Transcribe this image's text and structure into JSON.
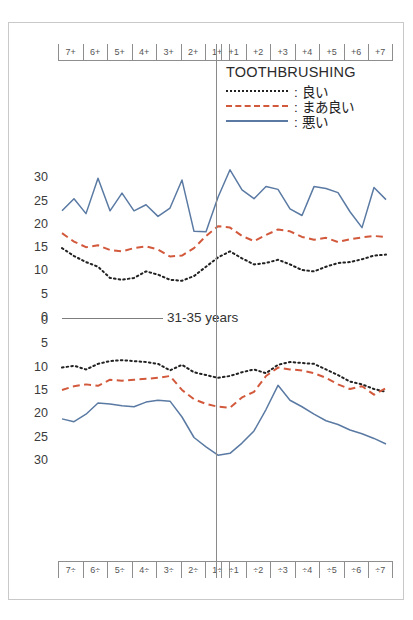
{
  "figure": {
    "center_label": "31-35 years",
    "legend": {
      "title": "TOOTHBRUSHING",
      "entries": [
        {
          "label": ": 良い",
          "style": "dotted",
          "color": "#222222"
        },
        {
          "label": ": まあ良い",
          "style": "dashed",
          "color": "#d2593c"
        },
        {
          "label": ": 悪い",
          "style": "solid",
          "color": "#5a7aa3"
        }
      ]
    },
    "upper_tooth_labels_left": [
      "7",
      "6",
      "5",
      "4",
      "3",
      "2",
      "1"
    ],
    "upper_tooth_labels_right": [
      "1",
      "2",
      "3",
      "4",
      "5",
      "6",
      "7"
    ],
    "lower_tooth_labels_left": [
      "7",
      "6",
      "5",
      "4",
      "3",
      "2",
      "1"
    ],
    "lower_tooth_labels_right": [
      "1",
      "2",
      "3",
      "4",
      "5",
      "6",
      "7"
    ],
    "upper_yticks": [
      "30",
      "25",
      "20",
      "15",
      "10",
      "5",
      "0"
    ],
    "lower_yticks": [
      "0",
      "5",
      "10",
      "15",
      "20",
      "25",
      "30"
    ]
  },
  "chart_data": {
    "type": "line",
    "title": "TOOTHBRUSHING",
    "subtitle": "31-35 years",
    "xlabel": "",
    "ylabel": "",
    "grid": false,
    "legend_position": "top-right",
    "panels": [
      {
        "name": "upper-arch",
        "ylim": [
          0,
          32
        ],
        "yticks": [
          30,
          25,
          20,
          15,
          10,
          5,
          0
        ],
        "y_direction": "value-increases-upward",
        "x": [
          "7+",
          "7+",
          "6+",
          "6+",
          "5+",
          "5+",
          "4+",
          "4+",
          "3+",
          "3+",
          "2+",
          "2+",
          "1+",
          "1+",
          "+1",
          "+1",
          "+2",
          "+2",
          "+3",
          "+3",
          "+4",
          "+4",
          "+5",
          "+5",
          "+6",
          "+6",
          "+7",
          "+7"
        ],
        "series": [
          {
            "name": "良い",
            "style": "dotted",
            "color": "#222222",
            "values": [
              15.0,
              13.3,
              12.0,
              11.0,
              8.6,
              8.2,
              8.6,
              10.0,
              9.3,
              8.2,
              8.0,
              9.0,
              11.0,
              13.0,
              14.3,
              12.8,
              11.5,
              11.8,
              12.5,
              11.5,
              10.3,
              10.0,
              11.0,
              11.8,
              12.0,
              12.6,
              13.4,
              13.6
            ]
          },
          {
            "name": "まあ良い",
            "style": "dashed",
            "color": "#d2593c",
            "values": [
              18.2,
              16.4,
              15.2,
              15.6,
              14.6,
              14.3,
              15.0,
              15.4,
              14.7,
              13.2,
              13.4,
              15.0,
              17.6,
              19.7,
              19.4,
              17.6,
              16.5,
              17.8,
              19.0,
              18.6,
              17.4,
              16.8,
              17.2,
              16.3,
              16.9,
              17.3,
              17.6,
              17.4
            ]
          },
          {
            "name": "悪い",
            "style": "solid",
            "color": "#5a7aa3",
            "values": [
              23.0,
              25.6,
              22.4,
              30.0,
              23.0,
              26.8,
              23.0,
              24.3,
              21.8,
              23.6,
              29.6,
              18.6,
              18.5,
              25.9,
              31.8,
              27.5,
              25.6,
              28.2,
              27.6,
              23.4,
              22.0,
              28.2,
              27.8,
              26.9,
              22.8,
              19.4,
              28.0,
              25.4
            ]
          }
        ]
      },
      {
        "name": "lower-arch",
        "ylim": [
          0,
          32
        ],
        "yticks": [
          0,
          5,
          10,
          15,
          20,
          25,
          30
        ],
        "y_direction": "value-increases-downward",
        "x": [
          "7÷",
          "7÷",
          "6÷",
          "6÷",
          "5÷",
          "5÷",
          "4÷",
          "4÷",
          "3÷",
          "3÷",
          "2÷",
          "2÷",
          "1÷",
          "1÷",
          "÷1",
          "÷1",
          "÷2",
          "÷2",
          "÷3",
          "÷3",
          "÷4",
          "÷4",
          "÷5",
          "÷5",
          "÷6",
          "÷6",
          "÷7",
          "÷7"
        ],
        "series": [
          {
            "name": "良い",
            "style": "dotted",
            "color": "#222222",
            "values": [
              10.0,
              9.6,
              10.4,
              9.2,
              8.6,
              8.4,
              8.6,
              8.8,
              9.2,
              10.6,
              9.4,
              11.0,
              11.6,
              12.2,
              11.8,
              11.0,
              10.4,
              11.2,
              9.4,
              8.8,
              9.0,
              9.2,
              10.4,
              11.6,
              13.0,
              13.6,
              14.6,
              15.2
            ]
          },
          {
            "name": "まあ良い",
            "style": "dashed",
            "color": "#d2593c",
            "values": [
              14.8,
              14.0,
              13.6,
              13.9,
              12.6,
              12.8,
              12.6,
              12.4,
              12.2,
              11.8,
              14.8,
              16.8,
              17.8,
              18.4,
              18.6,
              16.4,
              15.2,
              11.8,
              10.0,
              10.4,
              10.6,
              11.2,
              12.2,
              13.6,
              14.6,
              14.0,
              15.8,
              14.4
            ]
          },
          {
            "name": "悪い",
            "style": "solid",
            "color": "#5a7aa3",
            "values": [
              21.0,
              21.6,
              20.0,
              17.6,
              17.8,
              18.2,
              18.4,
              17.4,
              17.0,
              17.2,
              20.6,
              25.0,
              27.0,
              28.8,
              28.4,
              26.2,
              23.6,
              19.0,
              13.8,
              17.0,
              18.4,
              20.0,
              21.4,
              22.2,
              23.4,
              24.2,
              25.2,
              26.4
            ]
          }
        ]
      }
    ]
  }
}
